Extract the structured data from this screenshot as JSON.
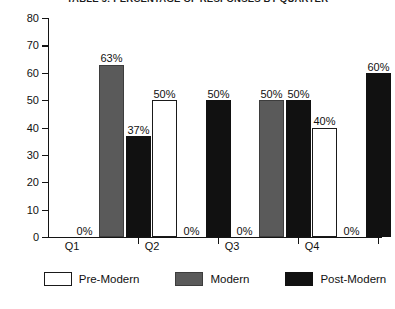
{
  "chart_data": {
    "type": "bar",
    "title": "TABLE 5: PERCENTAGE OF RESPONSES BY QUARTER",
    "xlabel": "",
    "ylabel": "",
    "ylim": [
      0,
      80
    ],
    "ytick_step": 10,
    "yticks": [
      "0",
      "10",
      "20",
      "30",
      "40",
      "50",
      "60",
      "70",
      "80"
    ],
    "grid": false,
    "legend_position": "bottom",
    "categories": [
      "Q1",
      "Q2",
      "Q3",
      "Q4"
    ],
    "series": [
      {
        "name": "Pre-Modern",
        "color": "#ffffff",
        "values": [
          0,
          50,
          0,
          40
        ],
        "labels": [
          "0%",
          "50%",
          "0%",
          "40%"
        ]
      },
      {
        "name": "Modern",
        "color": "#5a5a5a",
        "values": [
          63,
          0,
          50,
          0
        ],
        "labels": [
          "63%",
          "0%",
          "50%",
          "0%"
        ]
      },
      {
        "name": "Post-Modern",
        "color": "#111111",
        "values": [
          37,
          50,
          50,
          60
        ],
        "labels": [
          "37%",
          "50%",
          "50%",
          "60%"
        ]
      }
    ]
  },
  "legend": {
    "items": [
      {
        "label": "Pre-Modern"
      },
      {
        "label": "Modern"
      },
      {
        "label": "Post-Modern"
      }
    ]
  }
}
